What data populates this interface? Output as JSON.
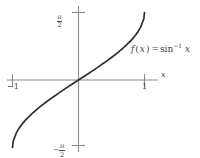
{
  "figure": {
    "title": "",
    "background_color": "#ffffff",
    "axis_color": "#8a8a8a",
    "curve_color": "#2f2f2f",
    "text_color": "#444444"
  },
  "labels": {
    "x_axis": "x",
    "x_tick_negative_one": "−1",
    "x_tick_one": "1",
    "y_tick_top_minus": "",
    "y_tick_bottom_minus": "−",
    "pi_symbol": "π",
    "two": "2",
    "function_f": "f",
    "function_paren_open": "(",
    "function_var": "x",
    "function_paren_close": ")",
    "function_equals": "=",
    "function_sin": "sin",
    "function_exponent": "−1",
    "function_arg": "x"
  },
  "chart_data": {
    "type": "line",
    "title": "",
    "xlabel": "x",
    "ylabel": "",
    "annotations": [
      {
        "text": "f(x) = sin⁻¹ x",
        "x": 0.72,
        "y": 0.95
      }
    ],
    "xlim": [
      -1.28,
      1.28
    ],
    "ylim": [
      -1.88,
      1.88
    ],
    "grid": false,
    "legend": null,
    "xticks": [
      -1,
      1
    ],
    "xticklabels": [
      "−1",
      "1"
    ],
    "yticks": [
      -1.5708,
      1.5708
    ],
    "yticklabels": [
      "−π/2",
      "π/2"
    ],
    "series": [
      {
        "name": "f(x) = sin^-1 x",
        "x": [
          -1.0,
          -0.99,
          -0.97,
          -0.94,
          -0.9,
          -0.85,
          -0.8,
          -0.7,
          -0.6,
          -0.5,
          -0.4,
          -0.3,
          -0.2,
          -0.1,
          0.0,
          0.1,
          0.2,
          0.3,
          0.4,
          0.5,
          0.6,
          0.7,
          0.8,
          0.85,
          0.9,
          0.94,
          0.97,
          0.99,
          1.0
        ],
        "y": [
          -1.5708,
          -1.4287,
          -1.3453,
          -1.2239,
          -1.1198,
          -1.016,
          -0.9273,
          -0.7754,
          -0.6435,
          -0.5236,
          -0.4115,
          -0.3047,
          -0.2014,
          -0.1002,
          0.0,
          0.1002,
          0.2014,
          0.3047,
          0.4115,
          0.5236,
          0.6435,
          0.7754,
          0.9273,
          1.016,
          1.1198,
          1.2239,
          1.3453,
          1.4287,
          1.5708
        ]
      }
    ]
  }
}
